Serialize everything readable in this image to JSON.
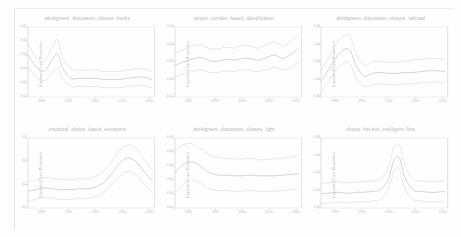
{
  "figure": {
    "background_color": "#fefefe",
    "line_color": "#c9c9ce",
    "band_color": "#dcdce0",
    "axis_color": "#dedee0",
    "text_color": "#b8b8bd"
  },
  "axes": {
    "ylabel": "Expected Topic Proportion",
    "xlabel": "",
    "xticks": [
      "1980",
      "1990",
      "2000",
      "2010",
      "2020"
    ],
    "xlim": [
      1975,
      2022
    ],
    "grid": false
  },
  "chart_data": [
    {
      "type": "line",
      "title": "abridgment, discussion, closure, trucks",
      "xlabel": "",
      "ylabel": "Expected Topic Proportion",
      "x": [
        1975,
        1978,
        1981,
        1984,
        1986,
        1988,
        1991,
        1994,
        1997,
        2000,
        2003,
        2006,
        2009,
        2012,
        2015,
        2018,
        2021
      ],
      "ylim": [
        0.0,
        0.06
      ],
      "yticks": [
        "0.00",
        "0.01",
        "0.02",
        "0.03",
        "0.04",
        "0.05"
      ],
      "series": [
        {
          "name": "upper",
          "values": [
            0.046,
            0.034,
            0.03,
            0.043,
            0.049,
            0.033,
            0.024,
            0.023,
            0.023,
            0.023,
            0.022,
            0.022,
            0.022,
            0.023,
            0.024,
            0.024,
            0.022
          ]
        },
        {
          "name": "mean",
          "values": [
            0.036,
            0.026,
            0.022,
            0.032,
            0.037,
            0.024,
            0.016,
            0.016,
            0.016,
            0.016,
            0.015,
            0.015,
            0.015,
            0.016,
            0.017,
            0.017,
            0.015
          ]
        },
        {
          "name": "lower",
          "values": [
            0.026,
            0.017,
            0.014,
            0.021,
            0.025,
            0.015,
            0.009,
            0.009,
            0.009,
            0.009,
            0.008,
            0.008,
            0.008,
            0.009,
            0.01,
            0.01,
            0.008
          ]
        }
      ]
    },
    {
      "type": "line",
      "title": "airport, corridor, based, identification",
      "xlabel": "",
      "ylabel": "Expected Topic Proportion",
      "x": [
        1975,
        1978,
        1981,
        1984,
        1986,
        1988,
        1991,
        1994,
        1997,
        2000,
        2003,
        2006,
        2009,
        2012,
        2015,
        2018,
        2021
      ],
      "ylim": [
        -0.02,
        0.06
      ],
      "yticks": [
        "-0.02",
        "0.00",
        "0.02",
        "0.04",
        "0.06"
      ],
      "yticks_pos": [
        -0.02,
        0.0,
        0.02,
        0.04,
        0.06
      ],
      "series": [
        {
          "name": "upper",
          "values": [
            0.03,
            0.034,
            0.038,
            0.04,
            0.038,
            0.035,
            0.035,
            0.037,
            0.036,
            0.039,
            0.038,
            0.036,
            0.04,
            0.043,
            0.038,
            0.044,
            0.052
          ]
        },
        {
          "name": "mean",
          "values": [
            0.016,
            0.02,
            0.023,
            0.025,
            0.024,
            0.021,
            0.021,
            0.023,
            0.022,
            0.024,
            0.024,
            0.022,
            0.025,
            0.028,
            0.024,
            0.029,
            0.036
          ]
        },
        {
          "name": "lower",
          "values": [
            0.003,
            0.006,
            0.009,
            0.011,
            0.01,
            0.008,
            0.008,
            0.01,
            0.009,
            0.011,
            0.01,
            0.009,
            0.011,
            0.014,
            0.011,
            0.014,
            0.021
          ]
        }
      ]
    },
    {
      "type": "line",
      "title": "abridgment, discussion, closure, railroad",
      "xlabel": "",
      "ylabel": "Expected Topic Proportion",
      "x": [
        1975,
        1978,
        1981,
        1984,
        1986,
        1988,
        1991,
        1994,
        1997,
        2000,
        2003,
        2006,
        2009,
        2012,
        2015,
        2018,
        2021
      ],
      "ylim": [
        0.0,
        0.08
      ],
      "yticks": [
        "0.00",
        "0.02",
        "0.04",
        "0.06",
        "0.08"
      ],
      "series": [
        {
          "name": "upper",
          "values": [
            0.03,
            0.046,
            0.062,
            0.071,
            0.068,
            0.05,
            0.036,
            0.04,
            0.041,
            0.04,
            0.04,
            0.041,
            0.042,
            0.043,
            0.044,
            0.044,
            0.043
          ]
        },
        {
          "name": "mean",
          "values": [
            0.018,
            0.032,
            0.047,
            0.055,
            0.052,
            0.036,
            0.024,
            0.027,
            0.028,
            0.027,
            0.027,
            0.028,
            0.028,
            0.029,
            0.03,
            0.03,
            0.029
          ]
        },
        {
          "name": "lower",
          "values": [
            0.006,
            0.018,
            0.032,
            0.04,
            0.037,
            0.022,
            0.012,
            0.014,
            0.015,
            0.014,
            0.014,
            0.015,
            0.015,
            0.016,
            0.017,
            0.017,
            0.016
          ]
        }
      ]
    },
    {
      "type": "line",
      "title": "empirical, choice, based, emissions",
      "xlabel": "",
      "ylabel": "Expected Topic Proportion",
      "x": [
        1975,
        1978,
        1981,
        1984,
        1986,
        1988,
        1991,
        1994,
        1997,
        2000,
        2003,
        2006,
        2009,
        2012,
        2015,
        2018,
        2021
      ],
      "ylim": [
        0.0,
        0.08
      ],
      "yticks": [
        "0.0",
        "0.2",
        "0.4",
        "0.6"
      ],
      "series": [
        {
          "name": "upper",
          "values": [
            0.03,
            0.032,
            0.035,
            0.034,
            0.033,
            0.033,
            0.032,
            0.034,
            0.033,
            0.036,
            0.042,
            0.053,
            0.066,
            0.072,
            0.068,
            0.056,
            0.044
          ]
        },
        {
          "name": "mean",
          "values": [
            0.019,
            0.021,
            0.023,
            0.022,
            0.021,
            0.021,
            0.021,
            0.022,
            0.022,
            0.024,
            0.029,
            0.039,
            0.051,
            0.057,
            0.053,
            0.042,
            0.031
          ]
        },
        {
          "name": "lower",
          "values": [
            0.008,
            0.01,
            0.012,
            0.011,
            0.01,
            0.01,
            0.01,
            0.011,
            0.011,
            0.013,
            0.017,
            0.026,
            0.036,
            0.042,
            0.038,
            0.028,
            0.018
          ]
        }
      ]
    },
    {
      "type": "line",
      "title": "abridgment, discussion, closure, light",
      "xlabel": "",
      "ylabel": "Expected Topic Proportion",
      "x": [
        1975,
        1978,
        1981,
        1984,
        1986,
        1988,
        1991,
        1994,
        1997,
        2000,
        2003,
        2006,
        2009,
        2012,
        2015,
        2018,
        2021
      ],
      "ylim": [
        -0.02,
        0.08
      ],
      "yticks": [
        "-0.02",
        "0.00",
        "0.02",
        "0.04",
        "0.06",
        "0.08"
      ],
      "series": [
        {
          "name": "upper",
          "values": [
            0.062,
            0.07,
            0.072,
            0.066,
            0.06,
            0.056,
            0.052,
            0.051,
            0.05,
            0.05,
            0.051,
            0.049,
            0.049,
            0.05,
            0.051,
            0.053,
            0.056
          ]
        },
        {
          "name": "mean",
          "values": [
            0.03,
            0.042,
            0.046,
            0.041,
            0.035,
            0.03,
            0.027,
            0.027,
            0.026,
            0.026,
            0.027,
            0.026,
            0.026,
            0.026,
            0.027,
            0.028,
            0.029
          ]
        },
        {
          "name": "lower",
          "values": [
            0.002,
            0.014,
            0.02,
            0.016,
            0.011,
            0.007,
            0.005,
            0.005,
            0.004,
            0.004,
            0.005,
            0.004,
            0.004,
            0.004,
            0.005,
            0.006,
            0.007
          ]
        }
      ]
    },
    {
      "type": "line",
      "title": "choice, hot-mix, intelligent, flow",
      "xlabel": "",
      "ylabel": "Expected Topic Proportion",
      "x": [
        1975,
        1978,
        1981,
        1984,
        1986,
        1988,
        1991,
        1994,
        1997,
        2000,
        2002,
        2004,
        2006,
        2009,
        2012,
        2015,
        2018,
        2021
      ],
      "ylim": [
        0.0,
        0.08
      ],
      "yticks": [
        "0.00",
        "0.02",
        "0.04",
        "0.06",
        "0.08"
      ],
      "series": [
        {
          "name": "upper",
          "values": [
            0.028,
            0.029,
            0.03,
            0.029,
            0.029,
            0.03,
            0.03,
            0.031,
            0.033,
            0.046,
            0.068,
            0.072,
            0.05,
            0.033,
            0.031,
            0.03,
            0.03,
            0.031
          ]
        },
        {
          "name": "mean",
          "values": [
            0.016,
            0.017,
            0.018,
            0.017,
            0.017,
            0.018,
            0.018,
            0.019,
            0.021,
            0.033,
            0.054,
            0.058,
            0.036,
            0.021,
            0.019,
            0.018,
            0.018,
            0.019
          ]
        },
        {
          "name": "lower",
          "values": [
            0.005,
            0.006,
            0.007,
            0.006,
            0.006,
            0.007,
            0.007,
            0.008,
            0.01,
            0.021,
            0.041,
            0.045,
            0.023,
            0.01,
            0.008,
            0.007,
            0.007,
            0.008
          ]
        }
      ]
    }
  ]
}
